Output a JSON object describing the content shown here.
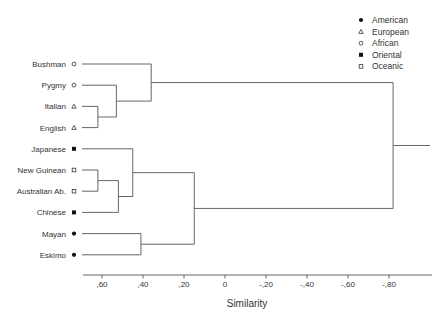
{
  "chart_data": {
    "type": "dendrogram",
    "title": "",
    "xlabel": "Similarity",
    "ylabel": "",
    "x_ticks": [
      0.6,
      0.4,
      0.2,
      0,
      -0.2,
      -0.4,
      -0.6,
      -0.8
    ],
    "x_tick_labels": [
      ",60",
      ",40",
      ",20",
      "0",
      "-,20",
      "-,40",
      "-,60",
      "-,80"
    ],
    "xlim": [
      0.7,
      -1.02
    ],
    "grid": false,
    "legend_position": "top-right",
    "legend": [
      {
        "label": "American",
        "marker": "filled-circle"
      },
      {
        "label": "European",
        "marker": "open-triangle"
      },
      {
        "label": "African",
        "marker": "open-circle"
      },
      {
        "label": "Oriental",
        "marker": "filled-square"
      },
      {
        "label": "Oceanic",
        "marker": "open-square"
      }
    ],
    "leaves": [
      {
        "label": "Bushman",
        "group": "African"
      },
      {
        "label": "Pygmy",
        "group": "African"
      },
      {
        "label": "Italian",
        "group": "European"
      },
      {
        "label": "English",
        "group": "European"
      },
      {
        "label": "Japanese",
        "group": "Oriental"
      },
      {
        "label": "New Guinean",
        "group": "Oceanic"
      },
      {
        "label": "Australian Ab.",
        "group": "Oceanic"
      },
      {
        "label": "Chinese",
        "group": "Oriental"
      },
      {
        "label": "Mayan",
        "group": "American"
      },
      {
        "label": "Eskimo",
        "group": "American"
      }
    ],
    "merges": [
      {
        "id": "m1",
        "children": [
          "Italian",
          "English"
        ],
        "similarity": 0.62
      },
      {
        "id": "m2",
        "children": [
          "Pygmy",
          "m1"
        ],
        "similarity": 0.53
      },
      {
        "id": "m3",
        "children": [
          "Bushman",
          "m2"
        ],
        "similarity": 0.36
      },
      {
        "id": "m4",
        "children": [
          "New Guinean",
          "Australian Ab."
        ],
        "similarity": 0.62
      },
      {
        "id": "m5",
        "children": [
          "m4",
          "Chinese"
        ],
        "similarity": 0.52
      },
      {
        "id": "m6",
        "children": [
          "Japanese",
          "m5"
        ],
        "similarity": 0.45
      },
      {
        "id": "m7",
        "children": [
          "Mayan",
          "Eskimo"
        ],
        "similarity": 0.41
      },
      {
        "id": "m8",
        "children": [
          "m6",
          "m7"
        ],
        "similarity": 0.15
      },
      {
        "id": "m9",
        "children": [
          "m3",
          "m8"
        ],
        "similarity": -0.82
      }
    ]
  }
}
